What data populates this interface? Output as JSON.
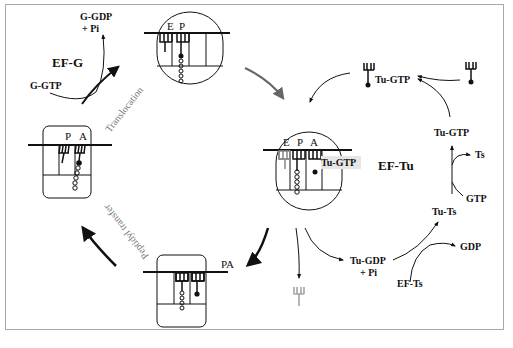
{
  "diagram": {
    "frame_color": "#a9a9a9",
    "factors": {
      "ef_g": "EF-G",
      "ef_tu": "EF-Tu"
    },
    "ef_g_cycle": {
      "input": "G-GTP",
      "output_line1": "G-GDP",
      "output_line2": "+ Pi"
    },
    "ef_tu_cycle": {
      "tu_gtp_center": "Tu-GTP",
      "tu_gtp_top": "Tu-GTP",
      "tu_gtp_right": "Tu-GTP",
      "ts": "Ts",
      "gtp": "GTP",
      "tu_ts": "Tu-Ts",
      "gdp": "GDP",
      "tu_gdp_line1": "Tu-GDP",
      "tu_gdp_line2": "+ Pi",
      "ef_ts": "EF-Ts"
    },
    "steps": {
      "translocation": "Translocation",
      "peptidyl_transfer": "Peptidyl transfer"
    },
    "ribosomes": {
      "top": {
        "sites": [
          "E",
          "P"
        ]
      },
      "center": {
        "sites": [
          "E",
          "P",
          "A"
        ]
      },
      "left": {
        "sites": [
          "P",
          "A"
        ]
      },
      "bottom": {
        "label": "PA"
      }
    }
  }
}
